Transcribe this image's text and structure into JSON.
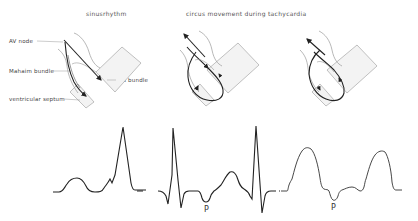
{
  "titles": {
    "sinus": "sinusrhythm",
    "circus": "circus movement  during  tachycardia"
  },
  "labels": {
    "av_node": "AV node",
    "mahaim_bundle": "Mahaim bundle",
    "his_bundle": "His bundle",
    "ventricular_septum": "ventricular septum"
  },
  "ecg": {
    "p_label_1": "P",
    "p_label_2": "P"
  },
  "colors": {
    "line": "#222222",
    "outline": "#8a8a8a",
    "shade": "#f2f2f2"
  }
}
